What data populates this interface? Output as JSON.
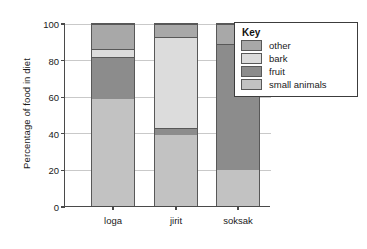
{
  "chart_data": {
    "type": "bar",
    "subtype": "stacked-bar-100-percent",
    "title": "",
    "xlabel": "",
    "ylabel": "Percentage of food in diet",
    "categories": [
      "loga",
      "jirit",
      "soksak"
    ],
    "ylim": [
      0,
      100
    ],
    "yticks": [
      0,
      20,
      40,
      60,
      80,
      100
    ],
    "ytick_labels": [
      "0",
      "20",
      "40",
      "60",
      "80",
      "100"
    ],
    "grid": true,
    "grid_axis": "y",
    "legend_position": "top-right-inside",
    "legend_title": "Key",
    "stack_order_bottom_to_top": [
      "small animals",
      "fruit",
      "bark",
      "other"
    ],
    "series": [
      {
        "name": "small animals",
        "color": "#c2c2c2",
        "values": [
          59,
          39,
          20
        ]
      },
      {
        "name": "fruit",
        "color": "#8c8c8c",
        "values": [
          23,
          4,
          69
        ]
      },
      {
        "name": "bark",
        "color": "#dcdcdc",
        "values": [
          4,
          50,
          0
        ]
      },
      {
        "name": "other",
        "color": "#a8a8a8",
        "values": [
          14,
          7,
          11
        ]
      }
    ],
    "cumulative_boundaries": {
      "loga": [
        0,
        59,
        82,
        86,
        100
      ],
      "jirit": [
        0,
        39,
        43,
        93,
        100
      ],
      "soksak": [
        0,
        20,
        89,
        89,
        100
      ]
    }
  },
  "legend": {
    "title": "Key",
    "items": [
      {
        "label": "other",
        "color": "#a8a8a8"
      },
      {
        "label": "bark",
        "color": "#dcdcdc"
      },
      {
        "label": "fruit",
        "color": "#8c8c8c"
      },
      {
        "label": "small animals",
        "color": "#c2c2c2"
      }
    ]
  },
  "axes": {
    "y_title": "Percentage of food in diet",
    "y_tick_labels": [
      "100",
      "80",
      "60",
      "40",
      "20",
      "0"
    ],
    "x_tick_labels": [
      "loga",
      "jirit",
      "soksak"
    ]
  },
  "colors": {
    "axis": "#4a4a4a",
    "grid": "#c9c9c9",
    "bar_outline": "#585858",
    "background": "#ffffff",
    "legend_border": "#3c3c3c"
  }
}
